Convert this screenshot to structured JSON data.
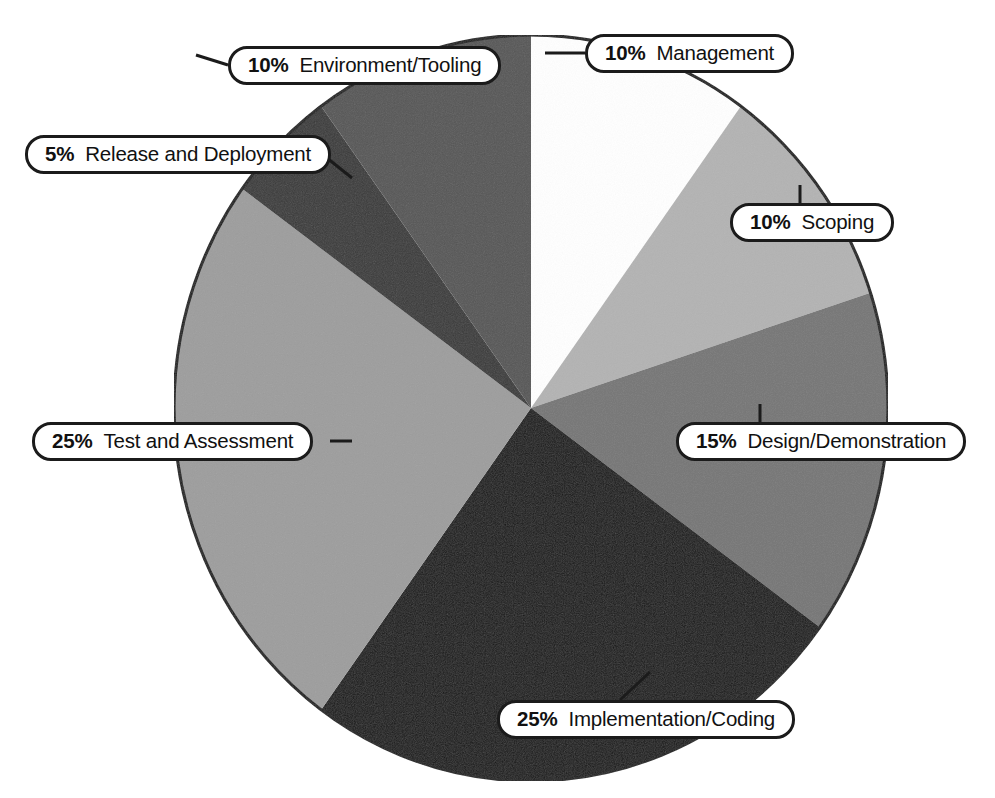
{
  "chart_data": {
    "type": "pie",
    "title": "",
    "subtitle": "",
    "xlabel": "",
    "ylabel": "",
    "legend_position": "callout-labels",
    "grid": false,
    "start_angle_deg": 0,
    "direction": "clockwise",
    "units": "percent",
    "total": 100,
    "categories": [
      "Management",
      "Scoping",
      "Design/Demonstration",
      "Implementation/Coding",
      "Test and Assessment",
      "Release and Deployment",
      "Environment/Tooling"
    ],
    "values": [
      10,
      10,
      15,
      25,
      25,
      5,
      10
    ],
    "slices": [
      {
        "label": "Management",
        "percent_text": "10%",
        "value": 10,
        "color": "#ffffff",
        "start_deg": 0,
        "end_deg": 36
      },
      {
        "label": "Scoping",
        "percent_text": "10%",
        "value": 10,
        "color": "#b3b3b3",
        "start_deg": 36,
        "end_deg": 72
      },
      {
        "label": "Design/Demonstration",
        "percent_text": "15%",
        "value": 15,
        "color": "#767676",
        "start_deg": 72,
        "end_deg": 126
      },
      {
        "label": "Implementation/Coding",
        "percent_text": "25%",
        "value": 25,
        "color": "#181818",
        "start_deg": 126,
        "end_deg": 216
      },
      {
        "label": "Test and Assessment",
        "percent_text": "25%",
        "value": 25,
        "color": "#9d9d9d",
        "start_deg": 216,
        "end_deg": 306
      },
      {
        "label": "Release and Deployment",
        "percent_text": "5%",
        "value": 5,
        "color": "#3a3a3a",
        "start_deg": 306,
        "end_deg": 324
      },
      {
        "label": "Environment/Tooling",
        "percent_text": "10%",
        "value": 10,
        "color": "#565656",
        "start_deg": 324,
        "end_deg": 360
      }
    ]
  },
  "callouts": {
    "management": {
      "percent": "10%",
      "label": "Management"
    },
    "scoping": {
      "percent": "10%",
      "label": "Scoping"
    },
    "design": {
      "percent": "15%",
      "label": "Design/Demonstration"
    },
    "implementation": {
      "percent": "25%",
      "label": "Implementation/Coding"
    },
    "test": {
      "percent": "25%",
      "label": "Test and Assessment"
    },
    "release": {
      "percent": "5%",
      "label": "Release and Deployment"
    },
    "environment": {
      "percent": "10%",
      "label": "Environment/Tooling"
    }
  },
  "style": {
    "outline_color": "#1b1b1b",
    "background": "#ffffff",
    "text_color": "#111111"
  }
}
